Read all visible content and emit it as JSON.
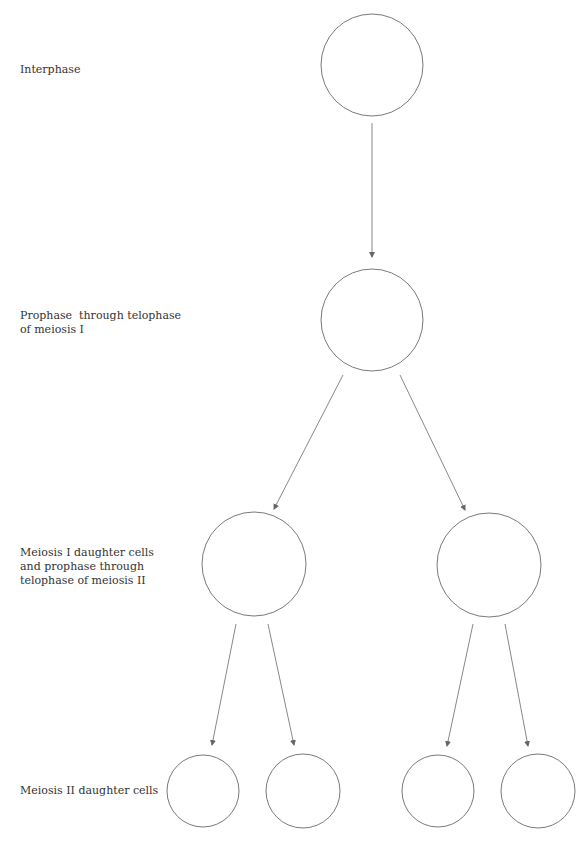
{
  "labels": {
    "interphase": "Interphase",
    "meiosis1_line1": "Prophase  through telophase",
    "meiosis1_line2": "of meiosis I",
    "meiosis2_line1": "Meiosis I daughter cells",
    "meiosis2_line2": "and prophase through",
    "meiosis2_line3": "telophase of meiosis II",
    "daughters": "Meiosis II daughter cells"
  },
  "colors": {
    "stroke": "#7a7a7a",
    "arrow": "#888888",
    "text": "#333333"
  }
}
